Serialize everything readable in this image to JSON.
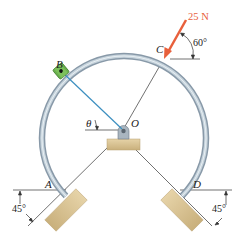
{
  "figure": {
    "points": {
      "A": "A",
      "B": "B",
      "C": "C",
      "D": "D",
      "O": "O"
    },
    "angle_symbol": "θ",
    "force": {
      "label": "25 N",
      "angle_label": "60°",
      "color": "#e8603c"
    },
    "support_left_angle": "45°",
    "support_right_angle": "45°",
    "colors": {
      "ring": "#9aacba",
      "ring_highlight": "#dfe8ee",
      "collar": "#6ab04c",
      "cord": "#3c8fc0",
      "support": "#d9c49b",
      "support_edge": "#b8a070"
    }
  }
}
